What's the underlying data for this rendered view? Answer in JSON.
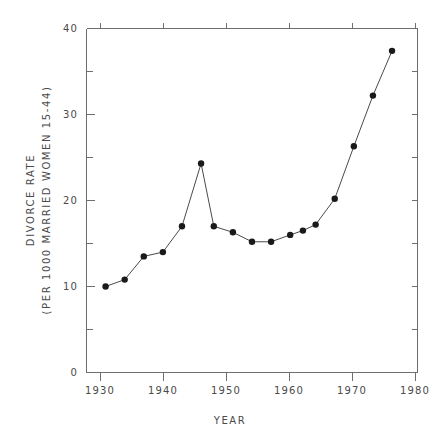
{
  "chart_data": {
    "type": "line",
    "title": "",
    "xlabel": "YEAR",
    "ylabel_line1": "DIVORCE RATE",
    "ylabel_line2": "(PER 1000 MARRIED WOMEN 15-44)",
    "xlim": [
      1928,
      1980
    ],
    "ylim": [
      0,
      40
    ],
    "grid": false,
    "legend": "none",
    "x_ticks": [
      1930,
      1940,
      1950,
      1960,
      1970,
      1980
    ],
    "x_tick_labels": [
      "1930",
      "1940",
      "1950",
      "1960",
      "1970",
      "1980"
    ],
    "y_ticks": [
      0,
      10,
      20,
      30,
      40
    ],
    "y_tick_labels": [
      "0",
      "10",
      "20",
      "30",
      "40"
    ],
    "y_minor_ticks": [
      5,
      15,
      25,
      35
    ],
    "x": [
      1931,
      1934,
      1937,
      1940,
      1943,
      1946,
      1948,
      1951,
      1954,
      1957,
      1960,
      1962,
      1964,
      1967,
      1970,
      1973,
      1976
    ],
    "values": [
      10.0,
      10.8,
      13.5,
      14.0,
      17.0,
      24.3,
      17.0,
      16.3,
      15.2,
      15.2,
      16.0,
      16.5,
      17.2,
      20.2,
      26.3,
      32.2,
      37.4
    ],
    "series_name": "Divorce rate",
    "marker": "filled-circle",
    "line_color": "#4a4a4a",
    "marker_color": "#1a1a1a"
  }
}
